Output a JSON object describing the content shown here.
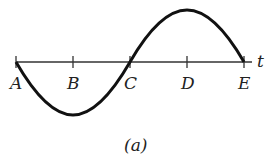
{
  "diagram": {
    "axis_label": "t",
    "points": [
      {
        "label": "A",
        "x": 16
      },
      {
        "label": "B",
        "x": 73
      },
      {
        "label": "C",
        "x": 130
      },
      {
        "label": "D",
        "x": 187
      },
      {
        "label": "E",
        "x": 244
      }
    ],
    "caption": "(a)",
    "curve": "one full sine period starting downward at A, minimum at B, crossing at C, maximum at D, returning to axis at E",
    "colors": {
      "line": "#111111",
      "axis": "#333333"
    }
  }
}
